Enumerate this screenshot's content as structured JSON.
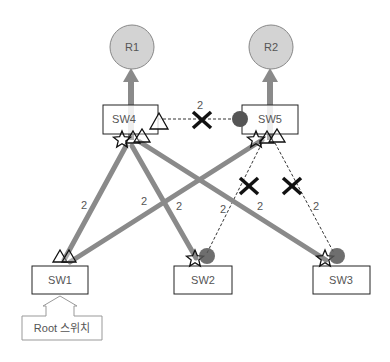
{
  "routers": [
    {
      "id": "R1",
      "label": "R1"
    },
    {
      "id": "R2",
      "label": "R2"
    }
  ],
  "switches": [
    {
      "id": "SW4",
      "label": "SW4"
    },
    {
      "id": "SW5",
      "label": "SW5"
    },
    {
      "id": "SW1",
      "label": "SW1"
    },
    {
      "id": "SW2",
      "label": "SW2"
    },
    {
      "id": "SW3",
      "label": "SW3"
    }
  ],
  "root_callout": {
    "label": "Root 스위치",
    "points_to": "SW1"
  },
  "links": [
    {
      "from": "SW4",
      "to": "SW5",
      "cost": "2",
      "state": "blocked"
    },
    {
      "from": "SW1",
      "to": "SW4",
      "cost": "2",
      "state": "forwarding"
    },
    {
      "from": "SW1",
      "to": "SW5",
      "cost": "2",
      "state": "forwarding"
    },
    {
      "from": "SW4",
      "to": "SW2",
      "cost": "2",
      "state": "forwarding"
    },
    {
      "from": "SW4",
      "to": "SW3",
      "cost": "2",
      "state": "forwarding"
    },
    {
      "from": "SW5",
      "to": "SW2",
      "cost": "2",
      "state": "blocked"
    },
    {
      "from": "SW5",
      "to": "SW3",
      "cost": "2",
      "state": "blocked"
    }
  ],
  "colors": {
    "forwarding_link": "#8a8a8a",
    "router_fill": "#d3d3d3",
    "blocked_port": "#555555",
    "block_mark": "#111111"
  }
}
